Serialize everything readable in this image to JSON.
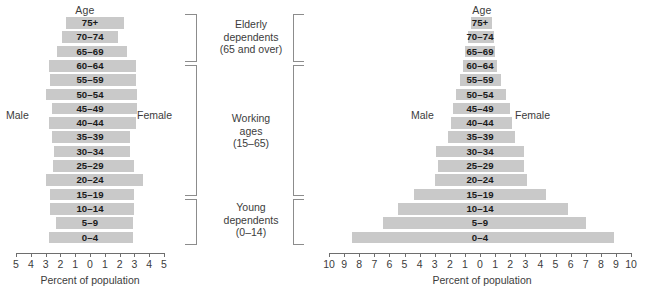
{
  "figure": {
    "age_header": "Age",
    "male_label": "Male",
    "female_label": "Female",
    "axis_caption": "Percent of population",
    "bar_color": "#c9c9c9",
    "axis_color": "#6e6e6e",
    "text_color": "#3c3c3c"
  },
  "groups": [
    {
      "id": "elderly",
      "line1": "Elderly",
      "line2": "dependents",
      "line3": "(65 and over)"
    },
    {
      "id": "working",
      "line1": "Working",
      "line2": "ages",
      "line3": "(15–65)"
    },
    {
      "id": "young",
      "line1": "Young",
      "line2": "dependents",
      "line3": "(0–14)"
    }
  ],
  "chart_data": [
    {
      "id": "left-pyramid",
      "type": "bar",
      "title": "Age",
      "xlabel": "Percent of population",
      "ylabel": "Age",
      "xlim": [
        -5,
        5
      ],
      "grid": false,
      "legend": [
        "Male",
        "Female"
      ],
      "legend_position": "inline-left-right",
      "tick_labels": [
        "5",
        "4",
        "3",
        "2",
        "1",
        "0",
        "1",
        "2",
        "3",
        "4",
        "5"
      ],
      "tick_values": [
        -5,
        -4,
        -3,
        -2,
        -1,
        0,
        1,
        2,
        3,
        4,
        5
      ],
      "categories": [
        "75+",
        "70–74",
        "65–69",
        "60–64",
        "55–59",
        "50–54",
        "45–49",
        "40–44",
        "35–39",
        "30–34",
        "25–29",
        "20–24",
        "15–19",
        "10–14",
        "5–9",
        "0–4"
      ],
      "series": [
        {
          "name": "Male",
          "values": [
            1.6,
            1.9,
            2.2,
            2.8,
            2.7,
            3.0,
            2.6,
            2.8,
            2.6,
            2.4,
            2.5,
            3.0,
            2.7,
            2.7,
            2.3,
            2.8
          ]
        },
        {
          "name": "Female",
          "values": [
            2.3,
            1.9,
            2.5,
            3.1,
            3.1,
            3.2,
            3.2,
            3.1,
            2.7,
            2.7,
            3.0,
            3.6,
            3.0,
            3.0,
            2.9,
            2.9
          ]
        }
      ]
    },
    {
      "id": "right-pyramid",
      "type": "bar",
      "title": "Age",
      "xlabel": "Percent of population",
      "ylabel": "Age",
      "xlim": [
        -10,
        10
      ],
      "grid": false,
      "legend": [
        "Male",
        "Female"
      ],
      "legend_position": "inline-left-right",
      "tick_labels": [
        "10",
        "9",
        "8",
        "7",
        "6",
        "5",
        "4",
        "3",
        "2",
        "1",
        "0",
        "1",
        "2",
        "3",
        "4",
        "5",
        "6",
        "7",
        "8",
        "9",
        "10"
      ],
      "tick_values": [
        -10,
        -9,
        -8,
        -7,
        -6,
        -5,
        -4,
        -3,
        -2,
        -1,
        0,
        1,
        2,
        3,
        4,
        5,
        6,
        7,
        8,
        9,
        10
      ],
      "categories": [
        "75+",
        "70–74",
        "65–69",
        "60–64",
        "55–59",
        "50–54",
        "45–49",
        "40–44",
        "35–39",
        "30–34",
        "25–29",
        "20–24",
        "15–19",
        "10–14",
        "5–9",
        "0–4"
      ],
      "series": [
        {
          "name": "Male",
          "values": [
            0.6,
            0.8,
            1.0,
            1.1,
            1.3,
            1.6,
            1.8,
            1.9,
            2.1,
            2.9,
            2.8,
            3.0,
            4.4,
            5.4,
            6.4,
            8.5
          ]
        },
        {
          "name": "Female",
          "values": [
            0.8,
            0.9,
            1.0,
            1.1,
            1.4,
            1.7,
            2.0,
            2.1,
            2.3,
            2.9,
            2.9,
            3.1,
            4.4,
            5.8,
            7.0,
            8.9
          ]
        }
      ]
    }
  ]
}
